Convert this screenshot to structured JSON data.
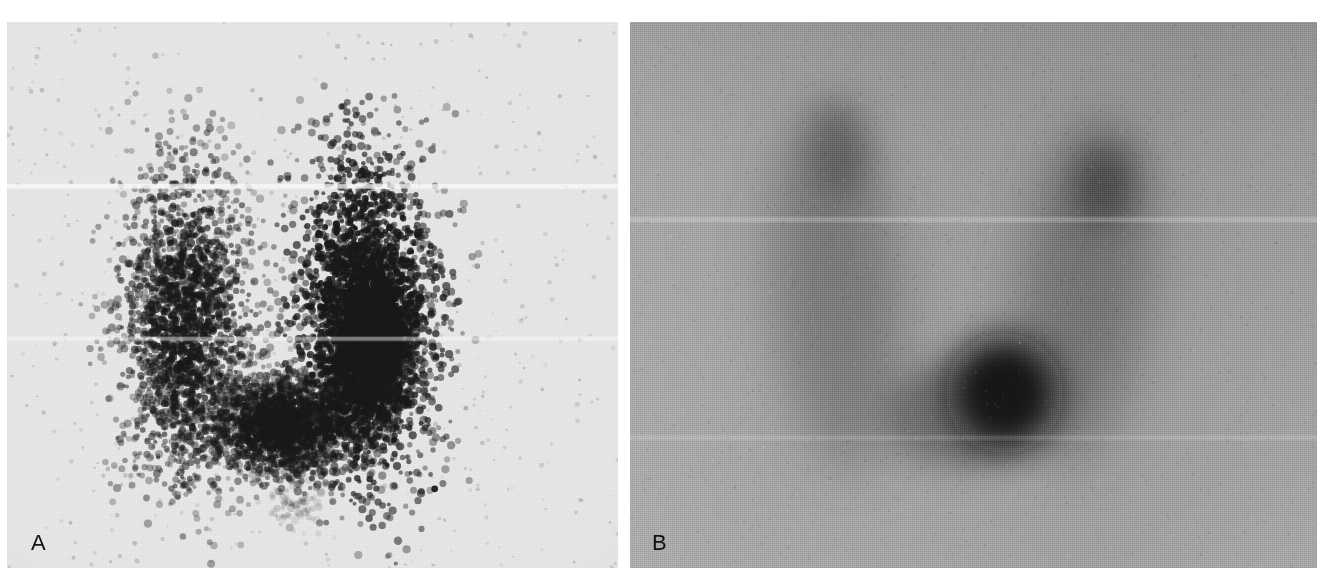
{
  "figure": {
    "type": "medical-imaging-figure",
    "modality": "thyroid scintigraphy",
    "panel_count": 2,
    "background_color": "#ffffff",
    "width": 1335,
    "height": 586
  },
  "panels": [
    {
      "id": "A",
      "label": "A",
      "name": "panel-a",
      "rendering": "dot-matrix scintigram",
      "background_color": "#e9e9e9",
      "dot_color": "#1c1c1c",
      "bounds": {
        "x": 7,
        "y": 22,
        "width": 611,
        "height": 546
      },
      "description": "Speckled dot-density gamma camera scan of a butterfly shaped thyroid gland with both lobes visible and a markedly denser right lobe",
      "features": [
        {
          "name": "left-lobe",
          "cx": 0.295,
          "cy": 0.56,
          "rx": 0.105,
          "ry": 0.29,
          "intensity": 0.72
        },
        {
          "name": "right-lobe",
          "cx": 0.585,
          "cy": 0.54,
          "rx": 0.115,
          "ry": 0.3,
          "intensity": 1.0
        },
        {
          "name": "isthmus",
          "cx": 0.45,
          "cy": 0.74,
          "rx": 0.115,
          "ry": 0.09,
          "intensity": 0.8
        },
        {
          "name": "hot-focus-right-lobe",
          "cx": 0.595,
          "cy": 0.6,
          "rx": 0.062,
          "ry": 0.125,
          "intensity": 1.0
        },
        {
          "name": "pyramidal-scatter",
          "cx": 0.47,
          "cy": 0.88,
          "rx": 0.055,
          "ry": 0.045,
          "intensity": 0.18
        },
        {
          "name": "marker-dot",
          "cx": 0.7,
          "cy": 0.855,
          "rx": 0.006,
          "ry": 0.006,
          "intensity": 1.0
        }
      ]
    },
    {
      "id": "B",
      "label": "B",
      "name": "panel-b",
      "rendering": "smoothed grayscale scintigram",
      "background_color": "#9c9c9c",
      "bounds": {
        "x": 630,
        "y": 22,
        "width": 687,
        "height": 546
      },
      "description": "Smoothed grayscale thyroid scan of the same gland showing a dominant dark focal area at the inferior mid-right and a second darker focus in the superior right lobe",
      "features": [
        {
          "name": "left-lobe",
          "cx": 0.3,
          "cy": 0.5,
          "rx": 0.09,
          "ry": 0.32,
          "intensity": 0.55
        },
        {
          "name": "right-lobe",
          "cx": 0.66,
          "cy": 0.49,
          "rx": 0.09,
          "ry": 0.32,
          "intensity": 0.6
        },
        {
          "name": "isthmus",
          "cx": 0.48,
          "cy": 0.72,
          "rx": 0.11,
          "ry": 0.095,
          "intensity": 0.7
        },
        {
          "name": "dominant-hot-nodule",
          "cx": 0.545,
          "cy": 0.68,
          "rx": 0.085,
          "ry": 0.11,
          "intensity": 1.0
        },
        {
          "name": "superior-right-focus",
          "cx": 0.69,
          "cy": 0.3,
          "rx": 0.045,
          "ry": 0.075,
          "intensity": 0.78
        },
        {
          "name": "superior-left-focus",
          "cx": 0.305,
          "cy": 0.23,
          "rx": 0.045,
          "ry": 0.09,
          "intensity": 0.62
        }
      ]
    }
  ]
}
